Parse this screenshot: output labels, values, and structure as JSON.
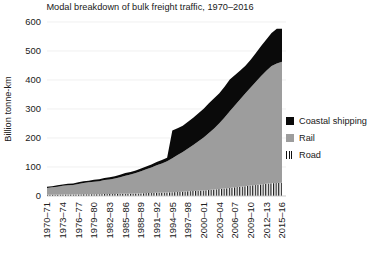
{
  "chart_data": {
    "type": "area",
    "title": "Modal breakdown of bulk freight traffic, 1970–2016",
    "xlabel": "",
    "ylabel": "Billion tonne-km",
    "ylim": [
      0,
      600
    ],
    "yticks": [
      0,
      100,
      200,
      300,
      400,
      500,
      600
    ],
    "grid": true,
    "stacked": true,
    "legend_position": "right",
    "legend": [
      "Coastal shipping",
      "Rail",
      "Road"
    ],
    "colors": {
      "coastal_shipping": "#0a0a0a",
      "rail": "#9d9d9d",
      "road": "#111111",
      "gridline": "#e9e9e9",
      "background": "#ffffff"
    },
    "categories": [
      "1970–71",
      "1971–72",
      "1972–73",
      "1973–74",
      "1974–75",
      "1975–76",
      "1976–77",
      "1977–78",
      "1978–79",
      "1979–80",
      "1980–81",
      "1981–82",
      "1982–83",
      "1983–84",
      "1984–85",
      "1985–86",
      "1986–87",
      "1987–88",
      "1988–89",
      "1989–90",
      "1990–91",
      "1991–92",
      "1992–93",
      "1993–94",
      "1994–95",
      "1995–96",
      "1996–97",
      "1997–98",
      "1998–99",
      "1999–00",
      "2000–01",
      "2001–02",
      "2002–03",
      "2003–04",
      "2004–05",
      "2005–06",
      "2006–07",
      "2007–08",
      "2008–09",
      "2009–10",
      "2010–11",
      "2011–12",
      "2012–13",
      "2013–14",
      "2014–15",
      "2015–16"
    ],
    "xtick_labels": [
      "1970–71",
      "1973–74",
      "1976–77",
      "1979–80",
      "1982–83",
      "1985–86",
      "1988–89",
      "1991–92",
      "1994–95",
      "1997–98",
      "2000–01",
      "2003–04",
      "2006–07",
      "2009–10",
      "2012–13",
      "2015–16"
    ],
    "xtick_every": 3,
    "series": [
      {
        "name": "Road",
        "values": [
          4,
          4,
          4,
          5,
          5,
          5,
          5,
          6,
          6,
          6,
          6,
          7,
          7,
          7,
          8,
          8,
          8,
          9,
          9,
          10,
          10,
          11,
          11,
          12,
          13,
          14,
          15,
          16,
          17,
          18,
          19,
          21,
          22,
          24,
          26,
          28,
          30,
          32,
          34,
          36,
          38,
          40,
          42,
          44,
          45,
          46
        ]
      },
      {
        "name": "Rail",
        "values": [
          24,
          26,
          28,
          30,
          32,
          33,
          36,
          39,
          41,
          43,
          45,
          48,
          50,
          53,
          57,
          62,
          66,
          70,
          76,
          82,
          88,
          95,
          101,
          108,
          117,
          127,
          137,
          148,
          159,
          171,
          183,
          196,
          211,
          227,
          245,
          264,
          283,
          302,
          320,
          338,
          356,
          374,
          390,
          404,
          412,
          417
        ]
      },
      {
        "name": "Coastal shipping",
        "values": [
          4,
          4,
          5,
          5,
          5,
          5,
          6,
          6,
          6,
          7,
          7,
          7,
          8,
          8,
          8,
          9,
          9,
          9,
          10,
          10,
          11,
          11,
          12,
          12,
          96,
          93,
          90,
          92,
          94,
          96,
          99,
          103,
          104,
          103,
          106,
          110,
          104,
          99,
          95,
          96,
          99,
          103,
          108,
          114,
          120,
          114
        ]
      }
    ]
  }
}
